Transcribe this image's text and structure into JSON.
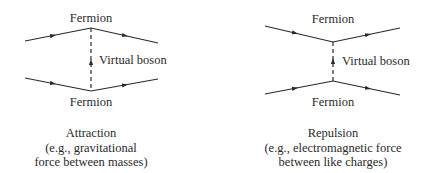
{
  "diagrams": [
    {
      "id": "attraction",
      "top_label": "Fermion",
      "bottom_label": "Fermion",
      "boson_label": "Virtual boson",
      "caption": {
        "line1": "Attraction",
        "line2": "(e.g., gravitational",
        "line3": "force between masses)"
      }
    },
    {
      "id": "repulsion",
      "top_label": "Fermion",
      "bottom_label": "Fermion",
      "boson_label": "Virtual boson",
      "caption": {
        "line1": "Repulsion",
        "line2": "(e.g., electromagnetic force",
        "line3": "between like charges)"
      }
    }
  ],
  "colors": {
    "line": "#2a2a2a",
    "background": "#ffffff"
  }
}
